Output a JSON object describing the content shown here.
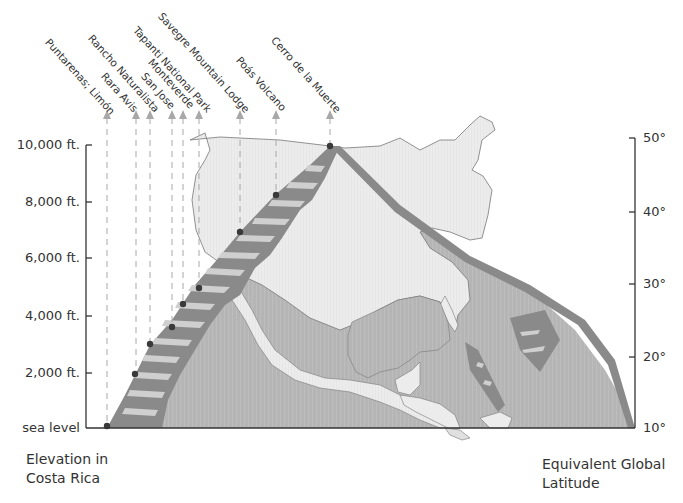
{
  "diagram": {
    "title": "",
    "left_axis": {
      "caption_line1": "Elevation in",
      "caption_line2": "Costa Rica",
      "ticks": [
        "10,000 ft.",
        "8,000 ft.",
        "6,000 ft.",
        "4,000 ft.",
        "2,000 ft.",
        "sea level"
      ]
    },
    "right_axis": {
      "caption_line1": "Equivalent Global",
      "caption_line2": "Latitude",
      "ticks": [
        "50°",
        "40°",
        "30°",
        "20°",
        "10°"
      ]
    },
    "locations": [
      {
        "name": "Puntarenas; Limón",
        "elevation_ft": 0
      },
      {
        "name": "Rara Avis",
        "elevation_ft": 1800
      },
      {
        "name": "Rancho Naturalista",
        "elevation_ft": 2900
      },
      {
        "name": "San Jose",
        "elevation_ft": 3500
      },
      {
        "name": "Monteverde",
        "elevation_ft": 4400
      },
      {
        "name": "Tapanti National Park",
        "elevation_ft": 5000
      },
      {
        "name": "Savegre Mountain Lodge",
        "elevation_ft": 6900
      },
      {
        "name": "Poás Volcano",
        "elevation_ft": 8300
      },
      {
        "name": "Cerro de la Muerte",
        "elevation_ft": 10000
      }
    ],
    "colors": {
      "land": "#ececec",
      "ocean": "#b8b8b8",
      "band": "#8a8a8a",
      "band_stripe": "#c8c8c8",
      "dot": "#3a3a3a",
      "arrow": "#a8a8a8",
      "axis": "#333333"
    }
  }
}
